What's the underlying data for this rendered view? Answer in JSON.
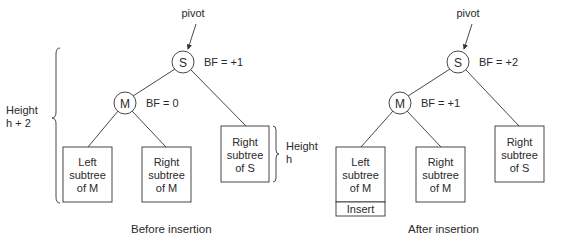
{
  "diagrams": [
    {
      "id": "before",
      "caption": "Before insertion",
      "pivot_label": "pivot",
      "root": {
        "letter": "S",
        "bf": "BF = +1"
      },
      "child": {
        "letter": "M",
        "bf": "BF = 0"
      },
      "left_subtree": {
        "line1": "Left",
        "line2": "subtree",
        "line3": "of M"
      },
      "mid_subtree": {
        "line1": "Right",
        "line2": "subtree",
        "line3": "of M"
      },
      "right_subtree": {
        "line1": "Right",
        "line2": "subtree",
        "line3": "of S"
      },
      "height_outer": {
        "line1": "Height",
        "line2": "h + 2"
      },
      "height_inner": {
        "line1": "Height",
        "line2": "h"
      }
    },
    {
      "id": "after",
      "caption": "After insertion",
      "pivot_label": "pivot",
      "root": {
        "letter": "S",
        "bf": "BF = +2"
      },
      "child": {
        "letter": "M",
        "bf": "BF = +1"
      },
      "left_subtree": {
        "line1": "Left",
        "line2": "subtree",
        "line3": "of M",
        "insert": "Insert"
      },
      "mid_subtree": {
        "line1": "Right",
        "line2": "subtree",
        "line3": "of M"
      },
      "right_subtree": {
        "line1": "Right",
        "line2": "subtree",
        "line3": "of S"
      }
    }
  ]
}
